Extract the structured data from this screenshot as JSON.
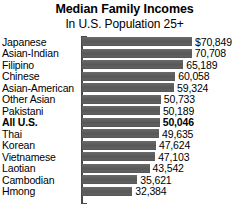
{
  "chart_data": {
    "type": "bar",
    "orientation": "horizontal",
    "title": "Median Family Incomes",
    "subtitle": "In U.S. Population 25+",
    "xlabel": "",
    "ylabel": "",
    "grid": false,
    "legend": "none",
    "xlim": [
      0,
      70849
    ],
    "bar_color": "#5c5c5c",
    "categories": [
      "Japanese",
      "Asian-Indian",
      "Filipino",
      "Chinese",
      "Asian-American",
      "Other Asian",
      "Pakistani",
      "All U.S.",
      "Thai",
      "Korean",
      "Vietnamese",
      "Laotian",
      "Cambodian",
      "Hmong"
    ],
    "values": [
      70849,
      70708,
      65189,
      60058,
      59324,
      50733,
      50189,
      50046,
      49635,
      47624,
      47103,
      43542,
      35621,
      32384
    ],
    "value_labels": [
      "$70,849",
      "70,708",
      "65,189",
      "60,058",
      "59,324",
      "50,733",
      "50,189",
      "50,046",
      "49,635",
      "47,624",
      "47,103",
      "43,542",
      "35,621",
      "32,384"
    ],
    "highlighted": [
      false,
      false,
      false,
      false,
      false,
      false,
      false,
      true,
      false,
      false,
      false,
      false,
      false,
      false
    ]
  }
}
